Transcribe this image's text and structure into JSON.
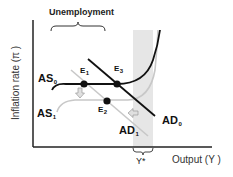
{
  "diagram": {
    "type": "AS-AD economic diagram",
    "axes": {
      "y_label": "Inflation rate (π )",
      "x_label": "Output (Y )"
    },
    "annotations": {
      "unemployment": "Unemployment",
      "potential_output": "Y*"
    },
    "curves": {
      "as0": {
        "label": "AS",
        "sub": "0",
        "color": "#111111"
      },
      "as1": {
        "label": "AS",
        "sub": "1",
        "color": "#c8c8c8"
      },
      "ad0": {
        "label": "AD",
        "sub": "0",
        "color": "#111111"
      },
      "ad1": {
        "label": "AD",
        "sub": "1",
        "color": "#c8c8c8"
      }
    },
    "points": {
      "e1": {
        "label": "E",
        "sub": "1"
      },
      "e2": {
        "label": "E",
        "sub": "2"
      },
      "e3": {
        "label": "E",
        "sub": "3"
      }
    },
    "arrows": {
      "as_shift": "down-arrow",
      "ad_shift": "left-arrow"
    },
    "colors": {
      "axis": "#222222",
      "shaded_band": "#e6e6e6",
      "arrow_fill": "#e0e0e0",
      "arrow_stroke": "#999999"
    }
  }
}
